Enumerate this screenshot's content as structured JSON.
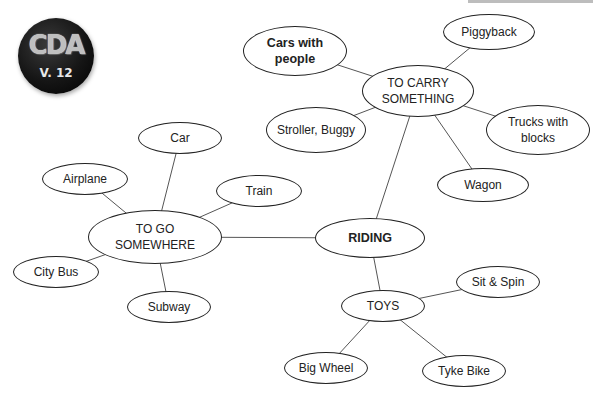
{
  "badge": {
    "title": "CDA",
    "version": "V. 12"
  },
  "diagram": {
    "type": "concept-map",
    "center": "RIDING",
    "nodes": [
      {
        "id": "riding",
        "label": "RIDING",
        "bold": true,
        "x": 315,
        "y": 218,
        "w": 110,
        "h": 40
      },
      {
        "id": "to-carry",
        "label": "TO CARRY SOMETHING",
        "bold": false,
        "x": 362,
        "y": 65,
        "w": 112,
        "h": 52
      },
      {
        "id": "cars-with-people",
        "label": "Cars with people",
        "bold": true,
        "x": 243,
        "y": 26,
        "w": 104,
        "h": 50
      },
      {
        "id": "piggyback",
        "label": "Piggyback",
        "bold": false,
        "x": 443,
        "y": 14,
        "w": 92,
        "h": 36
      },
      {
        "id": "stroller",
        "label": "Stroller, Buggy",
        "bold": false,
        "x": 266,
        "y": 107,
        "w": 100,
        "h": 46
      },
      {
        "id": "trucks",
        "label": "Trucks with blocks",
        "bold": false,
        "x": 486,
        "y": 105,
        "w": 104,
        "h": 50
      },
      {
        "id": "wagon",
        "label": "Wagon",
        "bold": false,
        "x": 437,
        "y": 168,
        "w": 92,
        "h": 34
      },
      {
        "id": "to-go",
        "label": "TO GO SOMEWHERE",
        "bold": false,
        "x": 88,
        "y": 210,
        "w": 134,
        "h": 54
      },
      {
        "id": "car",
        "label": "Car",
        "bold": false,
        "x": 138,
        "y": 122,
        "w": 84,
        "h": 32
      },
      {
        "id": "airplane",
        "label": "Airplane",
        "bold": false,
        "x": 42,
        "y": 163,
        "w": 86,
        "h": 32
      },
      {
        "id": "train",
        "label": "Train",
        "bold": false,
        "x": 216,
        "y": 175,
        "w": 86,
        "h": 32
      },
      {
        "id": "city-bus",
        "label": "City Bus",
        "bold": false,
        "x": 13,
        "y": 256,
        "w": 86,
        "h": 32
      },
      {
        "id": "subway",
        "label": "Subway",
        "bold": false,
        "x": 127,
        "y": 291,
        "w": 84,
        "h": 32
      },
      {
        "id": "toys",
        "label": "TOYS",
        "bold": false,
        "x": 341,
        "y": 290,
        "w": 84,
        "h": 32
      },
      {
        "id": "sit-spin",
        "label": "Sit & Spin",
        "bold": false,
        "x": 456,
        "y": 266,
        "w": 84,
        "h": 32
      },
      {
        "id": "big-wheel",
        "label": "Big Wheel",
        "bold": false,
        "x": 284,
        "y": 352,
        "w": 84,
        "h": 32
      },
      {
        "id": "tyke-bike",
        "label": "Tyke Bike",
        "bold": false,
        "x": 422,
        "y": 355,
        "w": 84,
        "h": 32
      }
    ],
    "edges": [
      [
        "riding",
        "to-carry"
      ],
      [
        "riding",
        "to-go"
      ],
      [
        "riding",
        "toys"
      ],
      [
        "to-carry",
        "cars-with-people"
      ],
      [
        "to-carry",
        "piggyback"
      ],
      [
        "to-carry",
        "stroller"
      ],
      [
        "to-carry",
        "trucks"
      ],
      [
        "to-carry",
        "wagon"
      ],
      [
        "to-go",
        "car"
      ],
      [
        "to-go",
        "airplane"
      ],
      [
        "to-go",
        "train"
      ],
      [
        "to-go",
        "city-bus"
      ],
      [
        "to-go",
        "subway"
      ],
      [
        "toys",
        "sit-spin"
      ],
      [
        "toys",
        "big-wheel"
      ],
      [
        "toys",
        "tyke-bike"
      ]
    ]
  }
}
